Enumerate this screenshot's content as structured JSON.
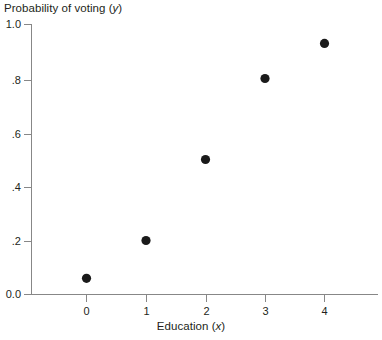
{
  "chart_data": {
    "type": "scatter",
    "title": "",
    "xlabel": "Education (x)",
    "ylabel": "Probability of voting (y)",
    "xlabel_text": "Education",
    "xlabel_var": "x",
    "ylabel_text": "Probability of voting",
    "ylabel_var": "y",
    "x": [
      0,
      1,
      2,
      3,
      4
    ],
    "values": [
      0.06,
      0.2,
      0.5,
      0.8,
      0.93
    ],
    "series": [
      {
        "name": "Probability of voting",
        "points": [
          {
            "x": 0,
            "y": 0.06
          },
          {
            "x": 1,
            "y": 0.2
          },
          {
            "x": 2,
            "y": 0.5
          },
          {
            "x": 3,
            "y": 0.8
          },
          {
            "x": 4,
            "y": 0.93
          }
        ]
      }
    ],
    "xlim": [
      -0.45,
      4.9
    ],
    "ylim": [
      0.0,
      1.0
    ],
    "ytick_values": [
      0.0,
      0.2,
      0.4,
      0.6,
      0.8,
      1.0
    ],
    "ytick_labels": [
      "0.0",
      ".2",
      ".4",
      ".6",
      ".8",
      "1.0"
    ],
    "xtick_values": [
      0,
      1,
      2,
      3,
      4
    ],
    "xtick_labels": [
      "0",
      "1",
      "2",
      "3",
      "4"
    ],
    "grid": false,
    "legend": "none",
    "marker": "filled-circle",
    "marker_color": "#1a1a1a",
    "axis_color": "#878787",
    "background_color": "#ffffff"
  },
  "axis_titles": {
    "y_prefix": "Probability of voting (",
    "y_var": "y",
    "y_suffix": ")",
    "x_prefix": "Education (",
    "x_var": "x",
    "x_suffix": ")"
  }
}
